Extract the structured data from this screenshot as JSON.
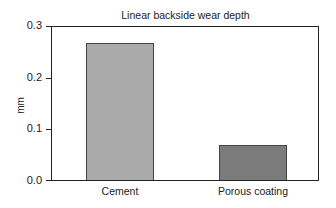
{
  "chart_data": {
    "type": "bar",
    "title": "Linear backside wear depth",
    "xlabel": "",
    "ylabel": "mm",
    "categories": [
      "Cement",
      "Porous coating"
    ],
    "values": [
      0.267,
      0.068
    ],
    "ylim": [
      0.0,
      0.3
    ],
    "yticks": [
      "0.0",
      "0.1",
      "0.2",
      "0.3"
    ],
    "grid": false,
    "legend": null,
    "colors": [
      "#aaaaaa",
      "#7b7b7b"
    ]
  }
}
